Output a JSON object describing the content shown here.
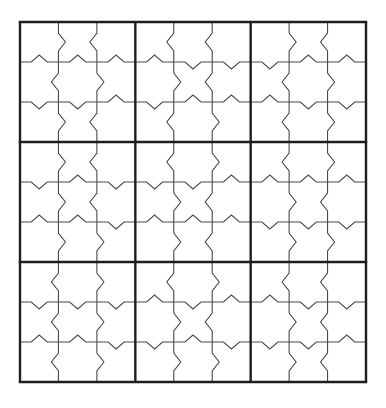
{
  "puzzle": {
    "type": "jigsaw-notched-sudoku-grid",
    "size": 9,
    "box_size": 3,
    "origin": [
      20,
      22
    ],
    "width": 346,
    "height": 360,
    "colors": {
      "thin_line": "#4a4a4a",
      "thick_line": "#1e1e1e",
      "background": "#ffffff"
    },
    "notch": {
      "depth": 7,
      "half_width": 7
    },
    "boxes": [
      {
        "v": [
          [
            "R",
            "L"
          ],
          [
            "L",
            "R"
          ],
          [
            "R",
            "L"
          ]
        ],
        "h": [
          [
            "U",
            "U",
            "U"
          ],
          [
            "D",
            "D",
            "U"
          ]
        ]
      },
      {
        "v": [
          [
            "L",
            "L"
          ],
          [
            "R",
            "L"
          ],
          [
            "L",
            "R"
          ]
        ],
        "h": [
          [
            "U",
            "D",
            "D"
          ],
          [
            "D",
            "U",
            "U"
          ]
        ]
      },
      {
        "v": [
          [
            "R",
            "L"
          ],
          [
            "L",
            "R"
          ],
          [
            "L",
            "R"
          ]
        ],
        "h": [
          [
            "D",
            "U",
            "U"
          ],
          [
            "U",
            "D",
            "D"
          ]
        ]
      },
      {
        "v": [
          [
            "R",
            "L"
          ],
          [
            "R",
            "L"
          ],
          [
            "R",
            "R"
          ]
        ],
        "h": [
          [
            "D",
            "U",
            "D"
          ],
          [
            "U",
            "U",
            "D"
          ]
        ]
      },
      {
        "v": [
          [
            "L",
            "R"
          ],
          [
            "R",
            "L"
          ],
          [
            "R",
            "L"
          ]
        ],
        "h": [
          [
            "D",
            "D",
            "U"
          ],
          [
            "U",
            "U",
            "U"
          ]
        ]
      },
      {
        "v": [
          [
            "L",
            "R"
          ],
          [
            "R",
            "L"
          ],
          [
            "R",
            "R"
          ]
        ],
        "h": [
          [
            "U",
            "U",
            "U"
          ],
          [
            "D",
            "D",
            "D"
          ]
        ]
      },
      {
        "v": [
          [
            "L",
            "R"
          ],
          [
            "L",
            "R"
          ],
          [
            "L",
            "R"
          ]
        ],
        "h": [
          [
            "D",
            "D",
            "D"
          ],
          [
            "U",
            "U",
            "D"
          ]
        ]
      },
      {
        "v": [
          [
            "L",
            "R"
          ],
          [
            "R",
            "L"
          ],
          [
            "R",
            "R"
          ]
        ],
        "h": [
          [
            "U",
            "D",
            "U"
          ],
          [
            "D",
            "U",
            "D"
          ]
        ]
      },
      {
        "v": [
          [
            "L",
            "L"
          ],
          [
            "R",
            "L"
          ],
          [
            "R",
            "L"
          ]
        ],
        "h": [
          [
            "U",
            "D",
            "D"
          ],
          [
            "D",
            "D",
            "U"
          ]
        ]
      }
    ],
    "cells": []
  }
}
